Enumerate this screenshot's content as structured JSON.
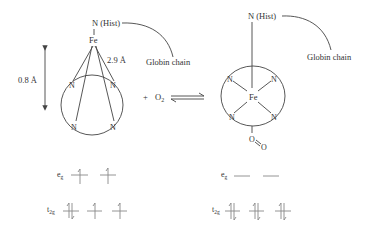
{
  "deoxy": {
    "axial_label": "N (Hist)",
    "metal": "Fe",
    "ring_atoms": [
      "N",
      "N",
      "N",
      "N"
    ],
    "displacement_label": "0.8 Å",
    "distance_label": "2.9 Å",
    "chain_label": "Globin chain",
    "orbitals": {
      "eg_label": "e",
      "eg_sub": "g",
      "t2g_label": "t",
      "t2g_sub": "2g",
      "eg_electrons": [
        "up",
        "up"
      ],
      "t2g_electrons": [
        "updown",
        "up",
        "up"
      ]
    }
  },
  "reaction": {
    "plus": "+",
    "reagent": "O",
    "reagent_sub": "2",
    "arrow": "equilibrium"
  },
  "oxy": {
    "axial_label": "N (Hist)",
    "metal": "Fe",
    "ring_atoms": [
      "N",
      "N",
      "N",
      "N"
    ],
    "ligand_o1": "O",
    "ligand_o2": "O",
    "chain_label": "Globin chain",
    "orbitals": {
      "eg_label": "e",
      "eg_sub": "g",
      "t2g_label": "t",
      "t2g_sub": "2g",
      "eg_electrons": [
        "empty",
        "empty"
      ],
      "t2g_electrons": [
        "updown",
        "updown",
        "updown"
      ]
    }
  },
  "colors": {
    "line": "#444444",
    "text": "#333333",
    "background": "#ffffff"
  }
}
